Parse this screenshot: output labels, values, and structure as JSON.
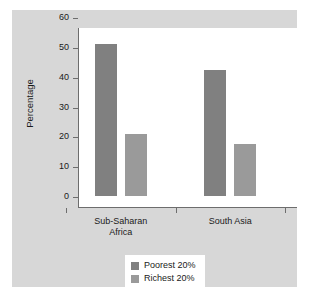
{
  "chart_data": {
    "type": "bar",
    "title": "",
    "xlabel": "",
    "ylabel": "Percentage",
    "ylim": [
      0,
      60
    ],
    "yticks": [
      0,
      10,
      20,
      30,
      40,
      50,
      60
    ],
    "ytick_labels": [
      "0",
      "10",
      "20",
      "30",
      "40",
      "50",
      "60"
    ],
    "grid": false,
    "legend_position": "bottom-center",
    "categories": [
      "Sub-Saharan\nAfrica",
      "South Asia"
    ],
    "series": [
      {
        "name": "Poorest 20%",
        "values": [
          51.5,
          43
        ],
        "color": "#808080"
      },
      {
        "name": "Richest 20%",
        "values": [
          21.5,
          18
        ],
        "color": "#9a9a9a"
      }
    ]
  },
  "figure": {
    "panel_color": "#d7d7d7",
    "plot_background": "#ffffff",
    "axis_color": "#6d6d6d",
    "text_color": "#1a1a1a"
  }
}
